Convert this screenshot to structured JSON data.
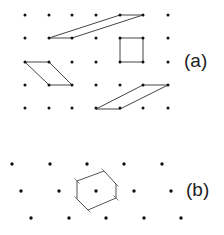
{
  "panel_a": {
    "label": "(a)",
    "grid": {
      "xs": [
        25,
        49,
        72,
        96,
        120,
        143,
        168
      ],
      "ys": [
        15,
        38,
        62,
        85,
        108
      ]
    },
    "shapes": [
      {
        "name": "parallelogram-top",
        "points": "120,15 143,15 72,38 49,38"
      },
      {
        "name": "square",
        "points": "120,38 143,38 143,62 120,62"
      },
      {
        "name": "parallelogram-left",
        "points": "25,62 49,62 72,85 49,85"
      },
      {
        "name": "parallelogram-bottom",
        "points": "143,85 168,85 120,109 96,109"
      }
    ]
  },
  "panel_b": {
    "label": "(b)",
    "rows": [
      {
        "y": 164,
        "xs": [
          12,
          50,
          87,
          124,
          162
        ]
      },
      {
        "y": 191,
        "xs": [
          21,
          59,
          96,
          134,
          171
        ]
      },
      {
        "y": 218,
        "xs": [
          31,
          69,
          106,
          144,
          181
        ]
      }
    ],
    "hexagon": {
      "points": "77,181 104,171 116,184 116,198 88,210 77,199"
    }
  }
}
